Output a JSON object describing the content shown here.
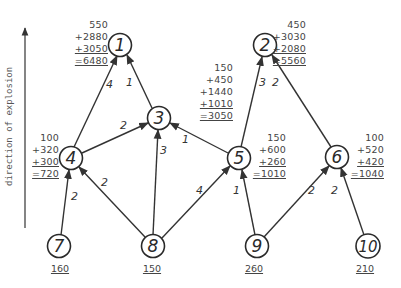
{
  "axis": {
    "label": "direction of explosion"
  },
  "nodes": [
    {
      "id": "1",
      "x": 120,
      "y": 45
    },
    {
      "id": "2",
      "x": 265,
      "y": 45
    },
    {
      "id": "3",
      "x": 159,
      "y": 118
    },
    {
      "id": "4",
      "x": 71,
      "y": 158
    },
    {
      "id": "5",
      "x": 239,
      "y": 158
    },
    {
      "id": "6",
      "x": 337,
      "y": 157
    },
    {
      "id": "7",
      "x": 59,
      "y": 246
    },
    {
      "id": "8",
      "x": 153,
      "y": 246
    },
    {
      "id": "9",
      "x": 257,
      "y": 246
    },
    {
      "id": "10",
      "x": 368,
      "y": 246
    }
  ],
  "edges": [
    {
      "from": "4",
      "to": "1",
      "weight": "4"
    },
    {
      "from": "3",
      "to": "1",
      "weight": "1"
    },
    {
      "from": "4",
      "to": "3",
      "weight": "2"
    },
    {
      "from": "8",
      "to": "3",
      "weight": "3"
    },
    {
      "from": "5",
      "to": "3",
      "weight": "1"
    },
    {
      "from": "5",
      "to": "2",
      "weight": "3"
    },
    {
      "from": "6",
      "to": "2",
      "weight": "2"
    },
    {
      "from": "7",
      "to": "4",
      "weight": "2"
    },
    {
      "from": "8",
      "to": "4",
      "weight": "2"
    },
    {
      "from": "8",
      "to": "5",
      "weight": "4"
    },
    {
      "from": "9",
      "to": "5",
      "weight": "1"
    },
    {
      "from": "9",
      "to": "6",
      "weight": "2"
    },
    {
      "from": "10",
      "to": "6",
      "weight": "2"
    }
  ],
  "sums": {
    "node1": {
      "base": "550",
      "add1": "+2880",
      "add2": "+3050",
      "total": "=6480"
    },
    "node2": {
      "base": "450",
      "add1": "+3030",
      "add2": "+2080",
      "total": "=5560"
    },
    "node3": {
      "base": "150",
      "add1": "+450",
      "add2": "+1440",
      "add3": "+1010",
      "total": "=3050"
    },
    "node4": {
      "base": "100",
      "add1": "+320",
      "add2": "+300",
      "total": "=720"
    },
    "node5": {
      "base": "150",
      "add1": "+600",
      "add2": "+260",
      "total": "=1010"
    },
    "node6": {
      "base": "100",
      "add1": "+520",
      "add2": "+420",
      "total": "=1040"
    }
  },
  "leaf_values": {
    "node7": "160",
    "node8": "150",
    "node9": "260",
    "node10": "210"
  }
}
